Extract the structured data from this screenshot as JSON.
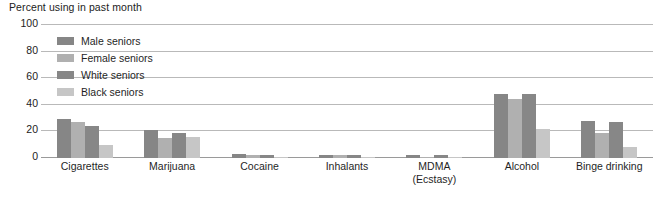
{
  "chart_data": {
    "type": "bar",
    "title": "Percent using in past month",
    "xlabel": "",
    "ylabel": "",
    "ylim": [
      0,
      100
    ],
    "yticks": [
      0,
      20,
      40,
      60,
      80,
      100
    ],
    "grid": true,
    "legend_position": "inside-top-left",
    "categories": [
      "Cigarettes",
      "Marijuana",
      "Cocaine",
      "Inhalants",
      "MDMA (Ecstasy)",
      "Alcohol",
      "Binge drinking"
    ],
    "category_labels": [
      {
        "line1": "Cigarettes",
        "line2": ""
      },
      {
        "line1": "Marijuana",
        "line2": ""
      },
      {
        "line1": "Cocaine",
        "line2": ""
      },
      {
        "line1": "Inhalants",
        "line2": ""
      },
      {
        "line1": "MDMA",
        "line2": "(Ecstasy)"
      },
      {
        "line1": "Alcohol",
        "line2": ""
      },
      {
        "line1": "Binge drinking",
        "line2": ""
      }
    ],
    "series": [
      {
        "name": "Male seniors",
        "color": "#868686",
        "values": [
          29,
          21,
          3,
          2,
          2,
          48,
          28
        ]
      },
      {
        "name": "Female seniors",
        "color": "#b0b0b0",
        "values": [
          27,
          15,
          2,
          2,
          1,
          44,
          19
        ]
      },
      {
        "name": "White seniors",
        "color": "#878787",
        "values": [
          24,
          19,
          2,
          2,
          2,
          48,
          27
        ]
      },
      {
        "name": "Black seniors",
        "color": "#c6c6c6",
        "values": [
          10,
          16,
          1,
          1,
          1,
          22,
          8
        ]
      }
    ]
  },
  "axis": {
    "ytick_labels": [
      "100",
      "80",
      "60",
      "40",
      "20",
      "0"
    ]
  },
  "legend": {
    "items": [
      {
        "label": "Male seniors",
        "color": "#868686"
      },
      {
        "label": "Female seniors",
        "color": "#b0b0b0"
      },
      {
        "label": "White seniors",
        "color": "#878787"
      },
      {
        "label": "Black seniors",
        "color": "#c6c6c6"
      }
    ]
  },
  "colors": {
    "gridline": "#b9b9b9",
    "baseline": "#9a9a9a",
    "text": "#1f1f1f",
    "background": "#ffffff"
  }
}
